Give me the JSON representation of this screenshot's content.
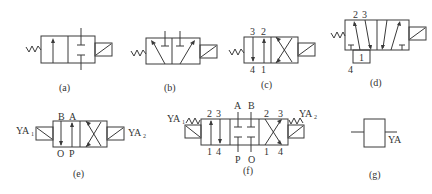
{
  "figure": {
    "panels": [
      {
        "id": "a",
        "caption": "(a)",
        "description": "2-position 2-way solenoid valve, spring return",
        "ports": []
      },
      {
        "id": "b",
        "caption": "(b)",
        "description": "2-position 3-way solenoid valve, spring return",
        "ports": []
      },
      {
        "id": "c",
        "caption": "(c)",
        "description": "2-position 4-way solenoid valve, spring return",
        "ports": {
          "top": [
            "3",
            "2"
          ],
          "bottom": [
            "4",
            "1"
          ]
        }
      },
      {
        "id": "d",
        "caption": "(d)",
        "description": "2-position 5-way solenoid valve, spring return",
        "ports": {
          "top": [
            "2",
            "3"
          ],
          "bottom_box": "1",
          "bottom_left": "4"
        }
      },
      {
        "id": "e",
        "caption": "(e)",
        "description": "2-position 4-way double solenoid valve",
        "ports": {
          "top": [
            "B",
            "A"
          ],
          "bottom": [
            "O",
            "P"
          ]
        },
        "solenoids": {
          "left": "YA",
          "left_sub": "1",
          "right": "YA",
          "right_sub": "2"
        }
      },
      {
        "id": "f",
        "caption": "(f)",
        "description": "3-position 4-way double solenoid valve, spring centered",
        "ports": {
          "left_top": [
            "2",
            "3"
          ],
          "left_bottom": [
            "1",
            "4"
          ],
          "center_top": [
            "A",
            "B"
          ],
          "center_bottom": [
            "P",
            "O"
          ],
          "right_top": [
            "2",
            "3"
          ],
          "right_bottom": [
            "1",
            "4"
          ]
        },
        "solenoids": {
          "left": "YA",
          "left_sub": "1",
          "right": "YA",
          "right_sub": "2"
        }
      },
      {
        "id": "g",
        "caption": "(g)",
        "description": "Solenoid coil symbol",
        "ports": {
          "coil": "YA"
        }
      }
    ]
  },
  "colors": {
    "line": "#3a3a3a",
    "text": "#333333",
    "background": "#ffffff"
  }
}
